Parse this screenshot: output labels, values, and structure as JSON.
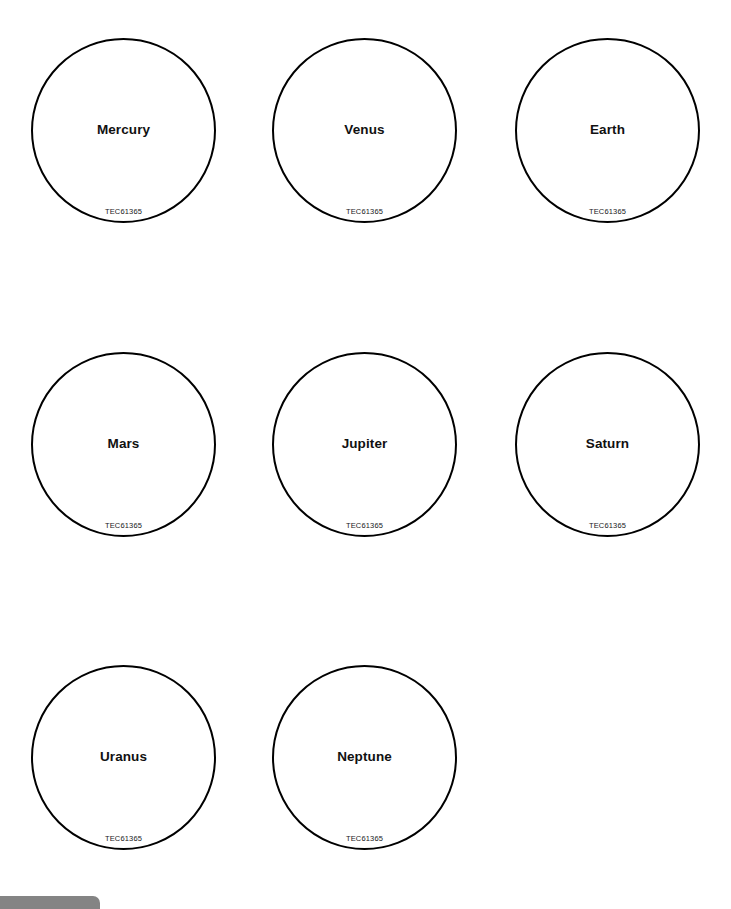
{
  "page": {
    "background_color": "#ffffff",
    "stroke_color": "#000000",
    "text_color": "#111111"
  },
  "planets": [
    {
      "name": "Mercury",
      "code": "TEC61365",
      "row": 0,
      "col": 0
    },
    {
      "name": "Venus",
      "code": "TEC61365",
      "row": 0,
      "col": 1
    },
    {
      "name": "Earth",
      "code": "TEC61365",
      "row": 0,
      "col": 2
    },
    {
      "name": "Mars",
      "code": "TEC61365",
      "row": 1,
      "col": 0
    },
    {
      "name": "Jupiter",
      "code": "TEC61365",
      "row": 1,
      "col": 1
    },
    {
      "name": "Saturn",
      "code": "TEC61365",
      "row": 1,
      "col": 2
    },
    {
      "name": "Uranus",
      "code": "TEC61365",
      "row": 2,
      "col": 0
    },
    {
      "name": "Neptune",
      "code": "TEC61365",
      "row": 2,
      "col": 1
    }
  ],
  "bottom_bar": {
    "color": "#6e6e6e"
  }
}
